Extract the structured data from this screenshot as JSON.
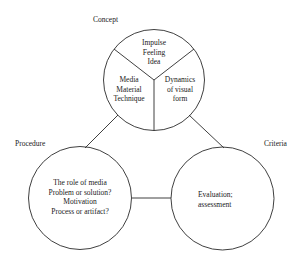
{
  "diagram": {
    "labels": {
      "concept": "Concept",
      "procedure": "Procedure",
      "criteria": "Criteria"
    },
    "concept_circle": {
      "top_segment": [
        "Impulse",
        "Feeling",
        "Idea"
      ],
      "left_segment": [
        "Media",
        "Material",
        "Technique"
      ],
      "right_segment": [
        "Dynamics",
        "of visual",
        "form"
      ]
    },
    "procedure_circle": {
      "lines": [
        "The role of media",
        "Problem or solution?",
        "Motivation",
        "Process or artifact?"
      ]
    },
    "criteria_circle": {
      "lines": [
        "Evaluation;",
        "assessment"
      ]
    },
    "colors": {
      "stroke": "#2a2a2a",
      "text": "#1a1a1a",
      "background": "#ffffff"
    }
  }
}
